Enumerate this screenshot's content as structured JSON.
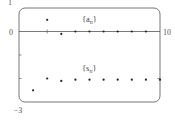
{
  "chart_data": {
    "type": "scatter",
    "title": "",
    "xlabel": "",
    "ylabel": "",
    "xlim": [
      0,
      10
    ],
    "ylim": [
      -3,
      1
    ],
    "x_tick_labels": [
      "0",
      "10"
    ],
    "y_tick_labels": [
      "1",
      "0",
      "-3"
    ],
    "y_ticks": [
      -1,
      -2
    ],
    "grid": false,
    "frame": "rounded-rectangle",
    "series": [
      {
        "name": "{a_n}",
        "label_text": "{a",
        "label_sub": "n",
        "label_close": "}",
        "points": [
          {
            "x": 2,
            "y": 0.5
          },
          {
            "x": 3,
            "y": -0.1
          },
          {
            "x": 4,
            "y": 0.0
          },
          {
            "x": 5,
            "y": 0.0
          },
          {
            "x": 6,
            "y": 0.0
          },
          {
            "x": 7,
            "y": 0.0
          },
          {
            "x": 8,
            "y": 0.0
          },
          {
            "x": 9,
            "y": 0.0
          }
        ]
      },
      {
        "name": "{s_n}",
        "label_text": "{s",
        "label_sub": "n",
        "label_close": "}",
        "points": [
          {
            "x": 1,
            "y": -2.5
          },
          {
            "x": 2,
            "y": -2.0
          },
          {
            "x": 3,
            "y": -2.1
          },
          {
            "x": 4,
            "y": -2.05
          },
          {
            "x": 5,
            "y": -2.05
          },
          {
            "x": 6,
            "y": -2.05
          },
          {
            "x": 7,
            "y": -2.05
          },
          {
            "x": 8,
            "y": -2.05
          },
          {
            "x": 9,
            "y": -2.05
          },
          {
            "x": 10,
            "y": -2.05
          }
        ]
      }
    ],
    "annotations": [
      {
        "text": "{a_n}",
        "x": 6.2,
        "y": 0.6
      },
      {
        "text": "{s_n}",
        "x": 6.2,
        "y": -1.5
      }
    ]
  },
  "axes": {
    "y_top": "1",
    "y_zero": "0",
    "y_bottom": "−3",
    "x_right": "10"
  },
  "labels": {
    "a_main": "{a",
    "a_sub": "n",
    "a_close": "}",
    "s_main": "{s",
    "s_sub": "n",
    "s_close": "}"
  },
  "colors": {
    "frame": "#666666",
    "axis": "#555555",
    "point": "#222222"
  }
}
